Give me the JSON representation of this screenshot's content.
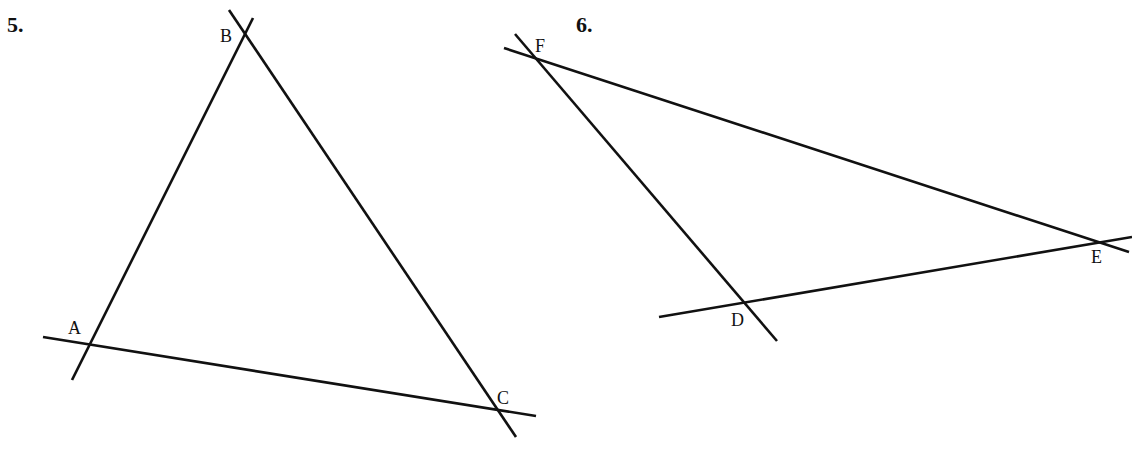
{
  "problems": [
    {
      "number": "5.",
      "vertices": {
        "A": "A",
        "B": "B",
        "C": "C"
      },
      "lines": [
        {
          "name": "line-AB",
          "x1": 72,
          "y1": 380,
          "x2": 253,
          "y2": 18
        },
        {
          "name": "line-BC",
          "x1": 229,
          "y1": 10,
          "x2": 516,
          "y2": 437
        },
        {
          "name": "line-AC",
          "x1": 43,
          "y1": 337,
          "x2": 536,
          "y2": 416
        }
      ]
    },
    {
      "number": "6.",
      "vertices": {
        "D": "D",
        "E": "E",
        "F": "F"
      },
      "lines": [
        {
          "name": "line-FD",
          "x1": 515,
          "y1": 34,
          "x2": 777,
          "y2": 341
        },
        {
          "name": "line-FE",
          "x1": 504,
          "y1": 48,
          "x2": 1129,
          "y2": 252
        },
        {
          "name": "line-DE",
          "x1": 659,
          "y1": 317,
          "x2": 1132,
          "y2": 237
        }
      ]
    }
  ],
  "colors": {
    "stroke": "#111111",
    "background": "#ffffff"
  }
}
